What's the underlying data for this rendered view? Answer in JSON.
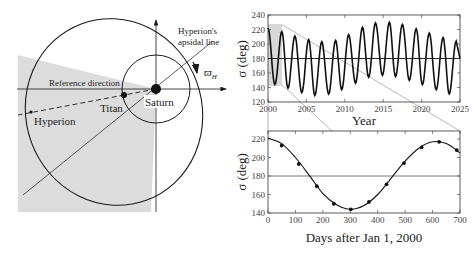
{
  "diagram": {
    "labels": {
      "apsidal_line_1": "Hyperion's",
      "apsidal_line_2": "apsidal line",
      "reference_direction": "Reference direction",
      "titan": "Titan",
      "saturn": "Saturn",
      "hyperion": "Hyperion",
      "varpi": "ϖ",
      "varpi_sub": "H"
    },
    "colors": {
      "wedge": "#dcdcdc",
      "line": "#1a1a1a"
    }
  },
  "chart_data": [
    {
      "type": "line",
      "title": "",
      "xlabel": "Year",
      "ylabel": "σ (deg)",
      "xlim": [
        2000,
        2025
      ],
      "ylim": [
        120,
        240
      ],
      "xticks": [
        "2000",
        "2005",
        "2010",
        "2015",
        "2020",
        "2025"
      ],
      "yticks": [
        "120",
        "140",
        "160",
        "180",
        "200",
        "220",
        "240"
      ],
      "reference_line": 180,
      "highlight_region": {
        "x": [
          2000,
          2002
        ],
        "y": [
          140,
          230
        ]
      },
      "series": [
        {
          "name": "sigma",
          "description": "Oscillation about 180 deg with period ~1.75 yr and slowly modulated amplitude",
          "period_years": 1.75,
          "peaks": [
            {
              "x": 2000.0,
              "y": 222
            },
            {
              "x": 2001.8,
              "y": 217
            },
            {
              "x": 2003.5,
              "y": 211
            },
            {
              "x": 2005.3,
              "y": 206
            },
            {
              "x": 2007.0,
              "y": 203
            },
            {
              "x": 2008.8,
              "y": 205
            },
            {
              "x": 2010.5,
              "y": 213
            },
            {
              "x": 2012.3,
              "y": 223
            },
            {
              "x": 2014.0,
              "y": 229
            },
            {
              "x": 2015.8,
              "y": 230
            },
            {
              "x": 2017.5,
              "y": 227
            },
            {
              "x": 2019.3,
              "y": 221
            },
            {
              "x": 2021.0,
              "y": 215
            },
            {
              "x": 2022.8,
              "y": 209
            },
            {
              "x": 2024.5,
              "y": 204
            }
          ],
          "troughs": [
            {
              "x": 2000.9,
              "y": 144
            },
            {
              "x": 2002.6,
              "y": 139
            },
            {
              "x": 2004.4,
              "y": 133
            },
            {
              "x": 2006.1,
              "y": 129
            },
            {
              "x": 2007.9,
              "y": 131
            },
            {
              "x": 2009.6,
              "y": 137
            },
            {
              "x": 2011.4,
              "y": 146
            },
            {
              "x": 2013.1,
              "y": 154
            },
            {
              "x": 2014.9,
              "y": 157
            },
            {
              "x": 2016.6,
              "y": 155
            },
            {
              "x": 2018.4,
              "y": 150
            },
            {
              "x": 2020.1,
              "y": 144
            },
            {
              "x": 2021.9,
              "y": 137
            },
            {
              "x": 2023.6,
              "y": 131
            }
          ]
        }
      ],
      "grid": false
    },
    {
      "type": "line",
      "title": "",
      "xlabel": "Days after Jan 1, 2000",
      "ylabel": "σ (deg)",
      "xlim": [
        0,
        700
      ],
      "ylim": [
        140,
        228
      ],
      "xticks": [
        "0",
        "100",
        "200",
        "300",
        "400",
        "500",
        "600",
        "700"
      ],
      "yticks": [
        "140",
        "160",
        "180",
        "200",
        "220"
      ],
      "reference_line": 180,
      "series": [
        {
          "name": "model curve",
          "style": "solid line",
          "x": [
            0,
            50,
            100,
            150,
            200,
            250,
            300,
            350,
            400,
            450,
            500,
            550,
            600,
            650,
            700
          ],
          "values": [
            221,
            215,
            200,
            181,
            161,
            149,
            144,
            148,
            160,
            178,
            196,
            210,
            217,
            215,
            205
          ]
        },
        {
          "name": "observations",
          "style": "markers",
          "x": [
            50,
            112,
            178,
            240,
            302,
            368,
            432,
            496,
            560,
            624,
            688
          ],
          "values": [
            213,
            193,
            169,
            150,
            144,
            152,
            171,
            194,
            211,
            217,
            208
          ]
        }
      ],
      "grid": false
    }
  ]
}
